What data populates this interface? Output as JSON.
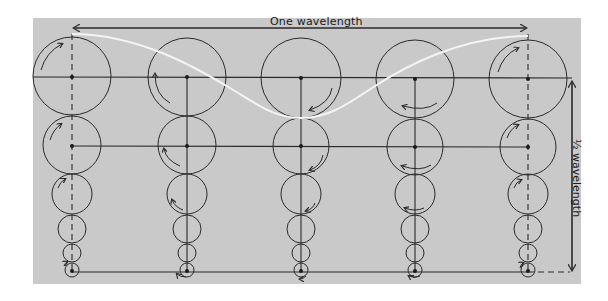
{
  "diagram": {
    "labels": {
      "one_wavelength": "One wavelength",
      "half_wavelength": "½ wavelength"
    },
    "colors": {
      "background": "#ffffff",
      "panel": "#c9c9c9",
      "line": "#2a2a2a",
      "wave_profile": "#f4f4f4"
    },
    "columns": [
      {
        "x": 72,
        "axis": "dashed",
        "phase": "crest"
      },
      {
        "x": 187,
        "axis": "solid",
        "phase": "falling"
      },
      {
        "x": 301,
        "axis": "solid",
        "phase": "trough"
      },
      {
        "x": 415,
        "axis": "solid",
        "phase": "rising"
      },
      {
        "x": 528,
        "axis": "dashed",
        "phase": "crest"
      }
    ],
    "orbit_rows": [
      {
        "cy": 76,
        "r": 39
      },
      {
        "cy": 145,
        "r": 29
      },
      {
        "cy": 194,
        "r": 20
      },
      {
        "cy": 229,
        "r": 14
      },
      {
        "cy": 253,
        "r": 9
      },
      {
        "cy": 270,
        "r": 7
      }
    ],
    "horizontal_lines_y": [
      77,
      146,
      272
    ],
    "wave_profile": {
      "crest_y": 34,
      "trough_y": 118,
      "x_start": 72,
      "x_end": 528
    },
    "arrows": {
      "wavelength_span": {
        "x1": 72,
        "x2": 528,
        "y": 28
      },
      "half_wavelength_span": {
        "x": 572,
        "y1": 80,
        "y2": 272
      }
    }
  }
}
